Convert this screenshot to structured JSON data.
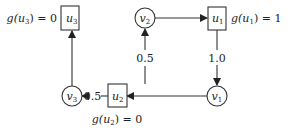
{
  "diagram": {
    "type": "directed graph",
    "nodes": [
      {
        "id": "u3",
        "shape": "square",
        "label_base": "u",
        "label_sub": "3",
        "annotation": "g(u3) = 0",
        "annotation_parts": {
          "pre": "g(u",
          "sub": "3",
          "post": ") = 0"
        }
      },
      {
        "id": "v2",
        "shape": "circle",
        "label_base": "v",
        "label_sub": "2"
      },
      {
        "id": "u1",
        "shape": "square",
        "label_base": "u",
        "label_sub": "1",
        "annotation": "g(u1) = 1",
        "annotation_parts": {
          "pre": "g(u",
          "sub": "1",
          "post": ") = 1"
        }
      },
      {
        "id": "v3",
        "shape": "circle",
        "label_base": "v",
        "label_sub": "3"
      },
      {
        "id": "u2",
        "shape": "square",
        "label_base": "u",
        "label_sub": "2",
        "annotation": "g(u2) = 0",
        "annotation_parts": {
          "pre": "g(u",
          "sub": "2",
          "post": ") = 0"
        }
      },
      {
        "id": "v1",
        "shape": "circle",
        "label_base": "v",
        "label_sub": "1"
      }
    ],
    "edges": [
      {
        "from": "v2",
        "to": "u1",
        "label": ""
      },
      {
        "from": "u1",
        "to": "v1",
        "label": "1.0"
      },
      {
        "from": "v1",
        "to": "u2",
        "label": ""
      },
      {
        "from": "u2",
        "to": "v2",
        "label": "0.5"
      },
      {
        "from": "u2",
        "to": "v3",
        "label": "0.5"
      },
      {
        "from": "v3",
        "to": "u3",
        "label": ""
      }
    ],
    "colors": {
      "stroke": "#333333",
      "text": "#222222",
      "background": "#ffffff"
    }
  }
}
